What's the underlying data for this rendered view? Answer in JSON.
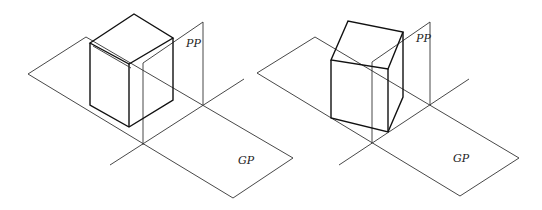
{
  "figures": [
    {
      "name": "left",
      "labels": {
        "picture_plane": "PP",
        "ground_plane": "GP"
      },
      "object": "cube parallel to picture plane"
    },
    {
      "name": "right",
      "labels": {
        "picture_plane": "PP",
        "ground_plane": "GP"
      },
      "object": "cube rotated relative to picture plane"
    }
  ],
  "colors": {
    "line": "#222222",
    "background": "#ffffff"
  }
}
